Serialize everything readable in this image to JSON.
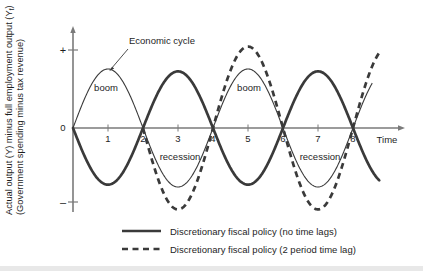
{
  "figure": {
    "background_color": "#ffffff",
    "curve_color": "#3a3a3a",
    "axis_color": "#7a7a7a",
    "text_color": "#1e1e1e"
  },
  "axes": {
    "y_label_line1": "Actual output (Y) minus full employment output (Y",
    "y_label_line1_sub": "f",
    "y_label_line1_end": ")",
    "y_label_line2": "(Government spending minus tax revenue)",
    "y_positive_sign": "+",
    "y_zero": "0",
    "y_negative_sign": "–",
    "x_axis_label": "Time",
    "x_ticks": [
      "1",
      "2",
      "3",
      "4",
      "5",
      "6",
      "7",
      "8"
    ]
  },
  "annotations": {
    "economic_cycle": "Economic cycle",
    "boom_1": "boom",
    "boom_2": "boom",
    "recession_1": "recession",
    "recession_2": "recession"
  },
  "legend": {
    "items": [
      {
        "style": "solid",
        "label": "Discretionary fiscal policy (no time lags)"
      },
      {
        "style": "dashed",
        "label": "Discretionary fiscal policy (2 period time lag)"
      }
    ]
  },
  "chart_data": {
    "type": "line",
    "title": "",
    "xlabel": "Time",
    "ylabel": "Actual output (Y) minus full employment output (Yf) / (Government spending minus tax revenue)",
    "xlim": [
      0,
      9.1
    ],
    "ylim": [
      -1.45,
      1.45
    ],
    "grid": false,
    "legend_position": "bottom",
    "x_tick_labels": [
      "1",
      "2",
      "3",
      "4",
      "5",
      "6",
      "7",
      "8"
    ],
    "x_tick_values": [
      1,
      2,
      3,
      4,
      5,
      6,
      7,
      8
    ],
    "y_tick_labels": [
      "+",
      "0",
      "–"
    ],
    "y_tick_values": [
      1.35,
      0,
      -1.3
    ],
    "series": [
      {
        "name": "Economic cycle",
        "style": "thin-solid",
        "form": "sin",
        "amplitude": 1.0,
        "period": 4,
        "phase": 0,
        "x_start": 0,
        "x_end": 8.55,
        "peaks": [
          {
            "x": 1,
            "y": 1.0
          },
          {
            "x": 5,
            "y": 1.0
          }
        ],
        "troughs": [
          {
            "x": 3,
            "y": -1.0
          },
          {
            "x": 7,
            "y": -1.0
          }
        ],
        "zeros": [
          0,
          2,
          4,
          6,
          8
        ],
        "booms": [
          [
            0,
            2
          ],
          [
            4,
            6
          ]
        ],
        "recessions": [
          [
            2,
            4
          ],
          [
            6,
            8
          ]
        ]
      },
      {
        "name": "Discretionary fiscal policy (no time lags)",
        "style": "thick-solid",
        "form": "negative-sin",
        "amplitude": 0.96,
        "period": 4,
        "phase": 2,
        "x_start": 0,
        "x_end": 8.75,
        "peaks": [
          {
            "x": 3,
            "y": 0.96
          },
          {
            "x": 7,
            "y": 0.96
          }
        ],
        "troughs": [
          {
            "x": 1,
            "y": -0.96
          },
          {
            "x": 5,
            "y": -0.96
          }
        ],
        "zeros": [
          0,
          2,
          4,
          6,
          8
        ]
      },
      {
        "name": "Discretionary fiscal policy (2 period time lag)",
        "style": "thick-dashed",
        "form": "sin-lagged",
        "amplitude": 1.38,
        "period": 4,
        "phase": 4,
        "lag_periods": 2,
        "x_start": 2,
        "x_end": 8.75,
        "peaks": [
          {
            "x": 5,
            "y": 1.38
          }
        ],
        "troughs": [
          {
            "x": 3,
            "y": -1.38
          },
          {
            "x": 7,
            "y": -1.38
          }
        ],
        "zeros": [
          2,
          4,
          6,
          8
        ]
      }
    ]
  }
}
